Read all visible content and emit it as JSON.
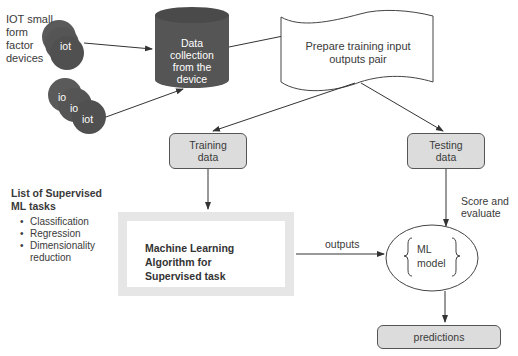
{
  "iot_group_label": "IOT small form factor devices",
  "iot_label_lines": [
    "IOT small",
    "form",
    "factor",
    "devices"
  ],
  "iot_device_text": "iot",
  "iot_device_partial_text": "io",
  "data_collection": {
    "lines": [
      "Data",
      "collection",
      "from the",
      "device"
    ]
  },
  "prepare_pairs": {
    "lines": [
      "Prepare training input",
      "outputs pair"
    ]
  },
  "training_data": {
    "lines": [
      "Training",
      "data"
    ]
  },
  "testing_data": {
    "lines": [
      "Testing",
      "data"
    ]
  },
  "score_label": {
    "lines": [
      "Score and",
      "evaluate"
    ]
  },
  "tasks_list": {
    "title_lines": [
      "List of Supervised",
      "ML tasks"
    ],
    "items": [
      "Classification",
      "Regression",
      "Dimensionality",
      "reduction"
    ]
  },
  "algorithm": {
    "lines": [
      "Machine Learning",
      "Algorithm for",
      "Supervised task"
    ]
  },
  "outputs_label": "outputs",
  "ml_model": {
    "lines": [
      "ML",
      "model"
    ]
  },
  "predictions": "predictions",
  "colors": {
    "dark_shape": "#555555",
    "gray_box": "#dcdcdc",
    "algo_border": "#e6e6e6",
    "line": "#333333"
  }
}
